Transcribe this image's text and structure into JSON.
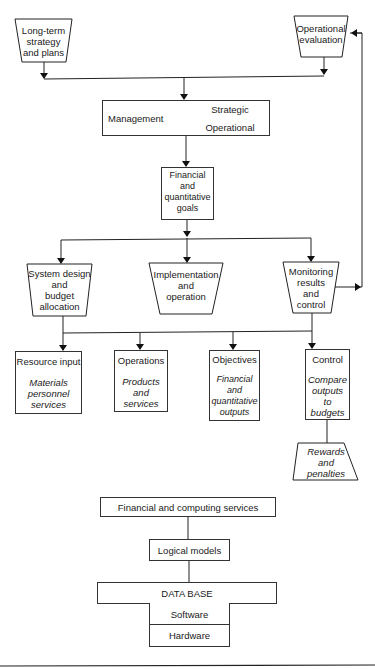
{
  "diagram": {
    "top_inputs": {
      "long_term": "Long-term\nstrategy\nand plans",
      "operational_evaluation": "Operational\nevaluation"
    },
    "management": {
      "label": "Management",
      "strategic": "Strategic",
      "operational": "Operational"
    },
    "goals": "Financial\nand\nquantitative\ngoals",
    "functions": {
      "system_design": "System design\nand\nbudget\nallocation",
      "implementation": "Implementation\nand\noperation",
      "monitoring": "Monitoring\nresults\nand\ncontrol"
    },
    "outputs": [
      {
        "title": "Resource input",
        "detail": "Materials\npersonnel\nservices"
      },
      {
        "title": "Operations",
        "detail": "Products\nand\nservices"
      },
      {
        "title": "Objectives",
        "detail": "Financial\nand\nquantitative\noutputs"
      },
      {
        "title": "Control",
        "detail": "Compare\noutputs\nto\nbudgets"
      }
    ],
    "rewards": "Rewards\nand\npenalties",
    "stack": {
      "services": "Financial and computing services",
      "logical_models": "Logical models",
      "database": "DATA BASE",
      "software": "Software",
      "hardware": "Hardware"
    }
  }
}
